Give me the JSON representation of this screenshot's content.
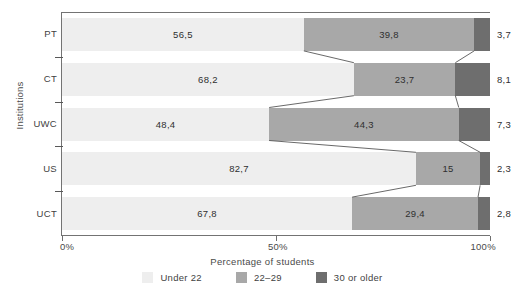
{
  "chart_data": {
    "type": "bar",
    "subtype": "stacked-horizontal-100-percent",
    "title": "",
    "xlabel": "Percentage of students",
    "ylabel": "Institutions",
    "xlim": [
      0,
      100
    ],
    "xticks": [
      0,
      50,
      100
    ],
    "xtick_labels": [
      "0%",
      "50%",
      "100%"
    ],
    "grid": false,
    "legend_position": "bottom",
    "categories": [
      "PT",
      "CT",
      "UWC",
      "US",
      "UCT"
    ],
    "series": [
      {
        "name": "Under 22",
        "color": "#eeeeee",
        "values": [
          56.5,
          68.2,
          48.4,
          82.7,
          67.8
        ],
        "labels": [
          "56,5",
          "68,2",
          "48,4",
          "82,7",
          "67,8"
        ]
      },
      {
        "name": "22–29",
        "color": "#a8a8a8",
        "values": [
          39.8,
          23.7,
          44.3,
          15.0,
          29.4
        ],
        "labels": [
          "39,8",
          "23,7",
          "44,3",
          "15",
          "29,4"
        ]
      },
      {
        "name": "30 or older",
        "color": "#6e6e6e",
        "values": [
          3.7,
          8.1,
          7.3,
          2.3,
          2.8
        ],
        "labels": [
          "3,7",
          "8,1",
          "7,3",
          "2,3",
          "2,8"
        ],
        "labels_outside": true
      }
    ]
  },
  "axes": {
    "y_title": "Institutions",
    "x_title": "Percentage of students",
    "x_tick_labels": [
      "0%",
      "50%",
      "100%"
    ]
  },
  "legend": {
    "items": [
      {
        "label": "Under 22",
        "color": "#eeeeee"
      },
      {
        "label": "22–29",
        "color": "#a8a8a8"
      },
      {
        "label": "30 or older",
        "color": "#6e6e6e"
      }
    ]
  },
  "colors": {
    "under22": "#eeeeee",
    "age22to29": "#a8a8a8",
    "age30plus": "#6e6e6e",
    "axis": "#737373",
    "text": "#3a3a3a",
    "connector": "#585858",
    "background": "#ffffff"
  }
}
